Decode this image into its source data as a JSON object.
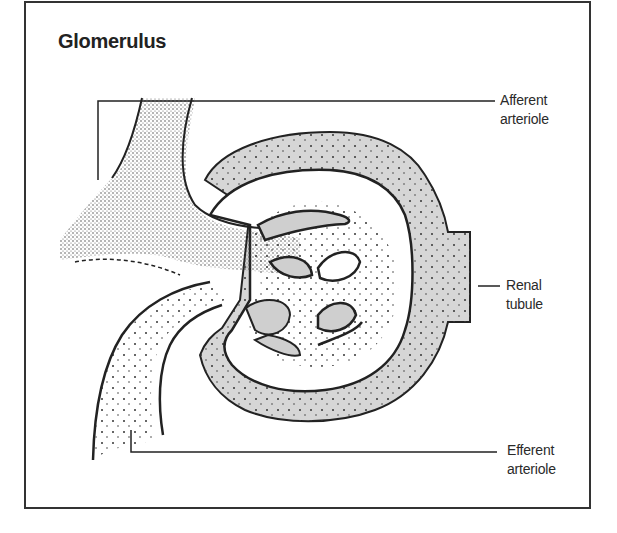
{
  "diagram": {
    "title": "Glomerulus",
    "labels": [
      {
        "id": "afferent",
        "line1": "Afferent",
        "line2": "arteriole"
      },
      {
        "id": "renal",
        "line1": "Renal",
        "line2": "tubule"
      },
      {
        "id": "efferent",
        "line1": "Efferent",
        "line2": "arteriole"
      }
    ],
    "colors": {
      "ink": "#222222",
      "shade": "#d9d9d9",
      "background": "#ffffff"
    }
  }
}
